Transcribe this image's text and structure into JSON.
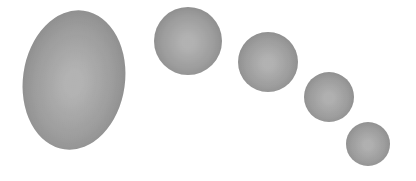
{
  "scene": {
    "description": "Five gray shaded spheres/ellipse decreasing in size along a curved arc",
    "background_color": "#ffffff",
    "shapes": [
      {
        "name": "large-ellipse",
        "kind": "ellipse",
        "center_color": "#bdbdbd",
        "edge_color": "#7e7e7e"
      },
      {
        "name": "sphere-2",
        "kind": "circle",
        "center_color": "#bcbcbc",
        "edge_color": "#7c7c7c"
      },
      {
        "name": "sphere-3",
        "kind": "circle",
        "center_color": "#bcbcbc",
        "edge_color": "#7e7e7e"
      },
      {
        "name": "sphere-4",
        "kind": "circle",
        "center_color": "#bababa",
        "edge_color": "#7e7e7e"
      },
      {
        "name": "sphere-5",
        "kind": "circle",
        "center_color": "#bababa",
        "edge_color": "#808080"
      }
    ]
  }
}
